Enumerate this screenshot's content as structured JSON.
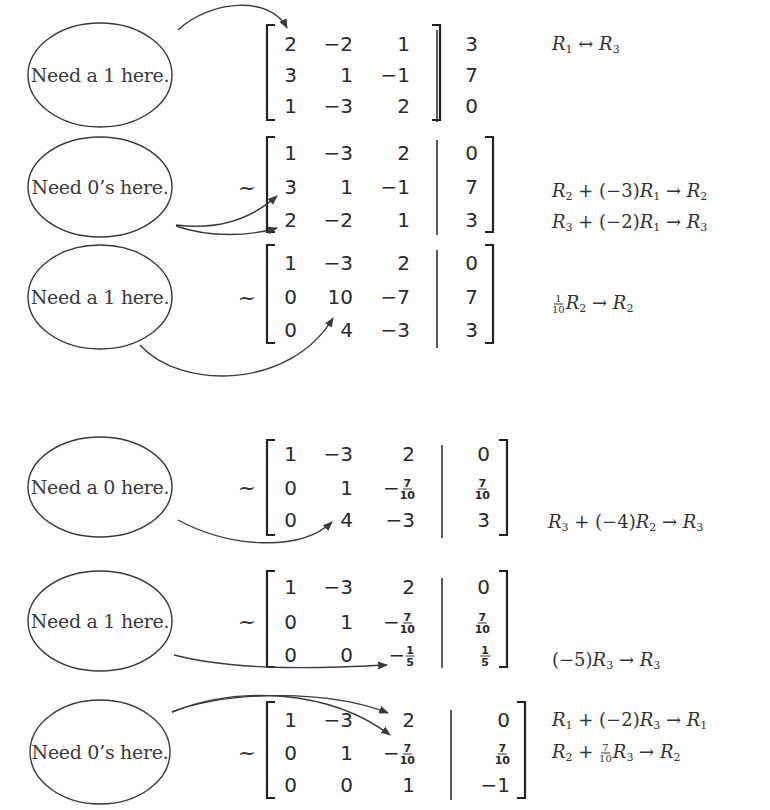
{
  "steps": [
    {
      "note": "Need a 1 here.",
      "tilde": "",
      "rows": [
        [
          "2",
          "−2",
          "1",
          "3"
        ],
        [
          "3",
          "1",
          "−1",
          "7"
        ],
        [
          "1",
          "−3",
          "2",
          "0"
        ]
      ],
      "ops": [
        "R₁ ↔ R₃"
      ]
    },
    {
      "note": "Need 0’s here.",
      "tilde": "~",
      "rows": [
        [
          "1",
          "−3",
          "2",
          "0"
        ],
        [
          "3",
          "1",
          "−1",
          "7"
        ],
        [
          "2",
          "−2",
          "1",
          "3"
        ]
      ],
      "ops": [
        "R₂ + (−3)R₁ → R₂",
        "R₃ + (−2)R₁ → R₃"
      ]
    },
    {
      "note": "Need a 1 here.",
      "tilde": "~",
      "rows": [
        [
          "1",
          "−3",
          "2",
          "0"
        ],
        [
          "0",
          "10",
          "−7",
          "7"
        ],
        [
          "0",
          "4",
          "−3",
          "3"
        ]
      ],
      "ops": [
        "1/10 R₂ → R₂"
      ]
    },
    {
      "note": "Need a 0 here.",
      "tilde": "~",
      "rows": [
        [
          "1",
          "−3",
          "2",
          "0"
        ],
        [
          "0",
          "1",
          "−7/10",
          "7/10"
        ],
        [
          "0",
          "4",
          "−3",
          "3"
        ]
      ],
      "ops": [
        "R₃ + (−4)R₂ → R₃"
      ]
    },
    {
      "note": "Need a 1 here.",
      "tilde": "~",
      "rows": [
        [
          "1",
          "−3",
          "2",
          "0"
        ],
        [
          "0",
          "1",
          "−7/10",
          "7/10"
        ],
        [
          "0",
          "0",
          "−1/5",
          "1/5"
        ]
      ],
      "ops": [
        "(−5)R₃ → R₃"
      ]
    },
    {
      "note": "Need 0’s here.",
      "tilde": "~",
      "rows": [
        [
          "1",
          "−3",
          "2",
          "0"
        ],
        [
          "0",
          "1",
          "−7/10",
          "7/10"
        ],
        [
          "0",
          "0",
          "1",
          "−1"
        ]
      ],
      "ops": [
        "R₁ + (−2)R₃ → R₁",
        "R₂ + 7/10 R₃ → R₂"
      ]
    }
  ],
  "colors": {
    "ink": "#2a2a2a",
    "background": "#ffffff"
  }
}
